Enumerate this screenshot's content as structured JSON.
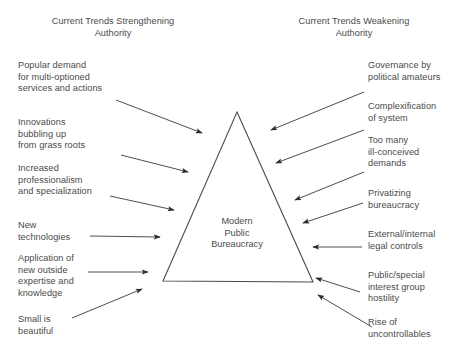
{
  "figure": {
    "center_label": "Modern\nPublic\nBureaucracy",
    "stroke_color": "#4a4a4a",
    "text_color": "#4a4a4a",
    "background_color": "#ffffff"
  },
  "headings": {
    "left": "Current Trends Strengthening\nAuthority",
    "right": "Current Trends Weakening\nAuthority"
  },
  "left_labels": [
    {
      "text": "Popular demand\nfor multi-optioned\nservices and actions",
      "top": 60
    },
    {
      "text": "Innovations\nbubbling up\nfrom grass roots",
      "top": 117
    },
    {
      "text": "Increased\nprofessionalism\nand specialization",
      "top": 163
    },
    {
      "text": "New\ntechnologies",
      "top": 220
    },
    {
      "text": "Application of\nnew outside\nexpertise and\nknowledge",
      "top": 253
    },
    {
      "text": "Small is\nbeautiful",
      "top": 314
    }
  ],
  "right_labels": [
    {
      "text": "Governance by\npolitical amateurs",
      "top": 60
    },
    {
      "text": "Complexification\nof system",
      "top": 101
    },
    {
      "text": "Too many\nill-conceived\ndemands",
      "top": 135
    },
    {
      "text": "Privatizing\nbureaucracy",
      "top": 188
    },
    {
      "text": "External/internal\nlegal controls",
      "top": 229
    },
    {
      "text": "Public/special\ninterest group\nhostility",
      "top": 270
    },
    {
      "text": "Rise of\nuncontrollables",
      "top": 317
    }
  ],
  "triangle": {
    "apex": {
      "x": 237,
      "y": 112
    },
    "base_left": {
      "x": 163,
      "y": 281
    },
    "base_right": {
      "x": 313,
      "y": 282
    }
  },
  "arrows_inward_left": [
    {
      "name": "arrow-popular-demand",
      "x1": 116,
      "y1": 100,
      "x2": 202,
      "y2": 133
    },
    {
      "name": "arrow-innovations",
      "x1": 121,
      "y1": 155,
      "x2": 188,
      "y2": 172
    },
    {
      "name": "arrow-professionalism",
      "x1": 110,
      "y1": 196,
      "x2": 174,
      "y2": 210
    },
    {
      "name": "arrow-new-technologies",
      "x1": 90,
      "y1": 236,
      "x2": 160,
      "y2": 237
    },
    {
      "name": "arrow-application",
      "x1": 88,
      "y1": 272,
      "x2": 148,
      "y2": 272
    },
    {
      "name": "arrow-small-is-beautiful",
      "x1": 72,
      "y1": 318,
      "x2": 142,
      "y2": 289
    }
  ],
  "arrows_inward_right": [
    {
      "name": "arrow-governance",
      "x1": 364,
      "y1": 92,
      "x2": 271,
      "y2": 130
    },
    {
      "name": "arrow-complexification",
      "x1": 364,
      "y1": 130,
      "x2": 276,
      "y2": 163
    },
    {
      "name": "arrow-too-many-demands",
      "x1": 364,
      "y1": 172,
      "x2": 295,
      "y2": 200
    },
    {
      "name": "arrow-privatizing",
      "x1": 363,
      "y1": 203,
      "x2": 303,
      "y2": 223
    },
    {
      "name": "arrow-legal-controls",
      "x1": 362,
      "y1": 247,
      "x2": 313,
      "y2": 247
    },
    {
      "name": "arrow-public-special",
      "x1": 360,
      "y1": 292,
      "x2": 316,
      "y2": 278
    },
    {
      "name": "arrow-rise-uncontrollables",
      "x1": 372,
      "y1": 327,
      "x2": 318,
      "y2": 295
    }
  ]
}
